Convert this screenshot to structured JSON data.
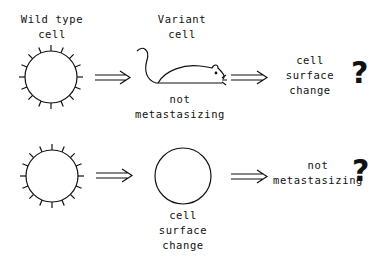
{
  "row1": {
    "start_label": "Wild type\ncell",
    "middle_label_top": "Variant\ncell",
    "middle_label_bottom": "not\nmetastasizing",
    "result_label": "cell\nsurface\nchange",
    "question": "?"
  },
  "row2": {
    "middle_label_bottom": "cell\nsurface\nchange",
    "result_label": "not\nmetastasizing",
    "question": "?"
  },
  "icons": {
    "cell_wild_type": "spiked-circle",
    "variant": "mouse",
    "cell_changed": "plain-circle",
    "arrow": "double-arrow"
  }
}
